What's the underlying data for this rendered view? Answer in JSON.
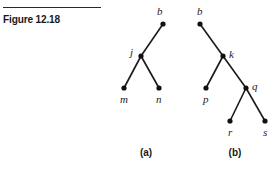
{
  "figure": {
    "title": "Figure 12.18"
  },
  "trees": [
    {
      "caption": "(a)",
      "caption_pos": [
        146,
        156
      ],
      "nodes": [
        {
          "id": "b",
          "label": "b",
          "x": 163,
          "y": 24,
          "lx": 157,
          "ly": 15
        },
        {
          "id": "j",
          "label": "j",
          "x": 141,
          "y": 56,
          "lx": 130,
          "ly": 56
        },
        {
          "id": "m",
          "label": "m",
          "x": 124,
          "y": 88,
          "lx": 120,
          "ly": 103
        },
        {
          "id": "n",
          "label": "n",
          "x": 159,
          "y": 88,
          "lx": 156,
          "ly": 103
        }
      ],
      "edges": [
        [
          "b",
          "j"
        ],
        [
          "j",
          "m"
        ],
        [
          "j",
          "n"
        ]
      ]
    },
    {
      "caption": "(b)",
      "caption_pos": [
        235,
        156
      ],
      "nodes": [
        {
          "id": "b",
          "label": "b",
          "x": 200,
          "y": 24,
          "lx": 197,
          "ly": 15
        },
        {
          "id": "k",
          "label": "k",
          "x": 223,
          "y": 56,
          "lx": 229,
          "ly": 58
        },
        {
          "id": "p",
          "label": "p",
          "x": 206,
          "y": 88,
          "lx": 203,
          "ly": 103
        },
        {
          "id": "q",
          "label": "q",
          "x": 246,
          "y": 88,
          "lx": 252,
          "ly": 90
        },
        {
          "id": "r",
          "label": "r",
          "x": 230,
          "y": 121,
          "lx": 228,
          "ly": 136
        },
        {
          "id": "s",
          "label": "s",
          "x": 265,
          "y": 121,
          "lx": 263,
          "ly": 136
        }
      ],
      "edges": [
        [
          "b",
          "k"
        ],
        [
          "k",
          "p"
        ],
        [
          "k",
          "q"
        ],
        [
          "q",
          "r"
        ],
        [
          "q",
          "s"
        ]
      ]
    }
  ]
}
